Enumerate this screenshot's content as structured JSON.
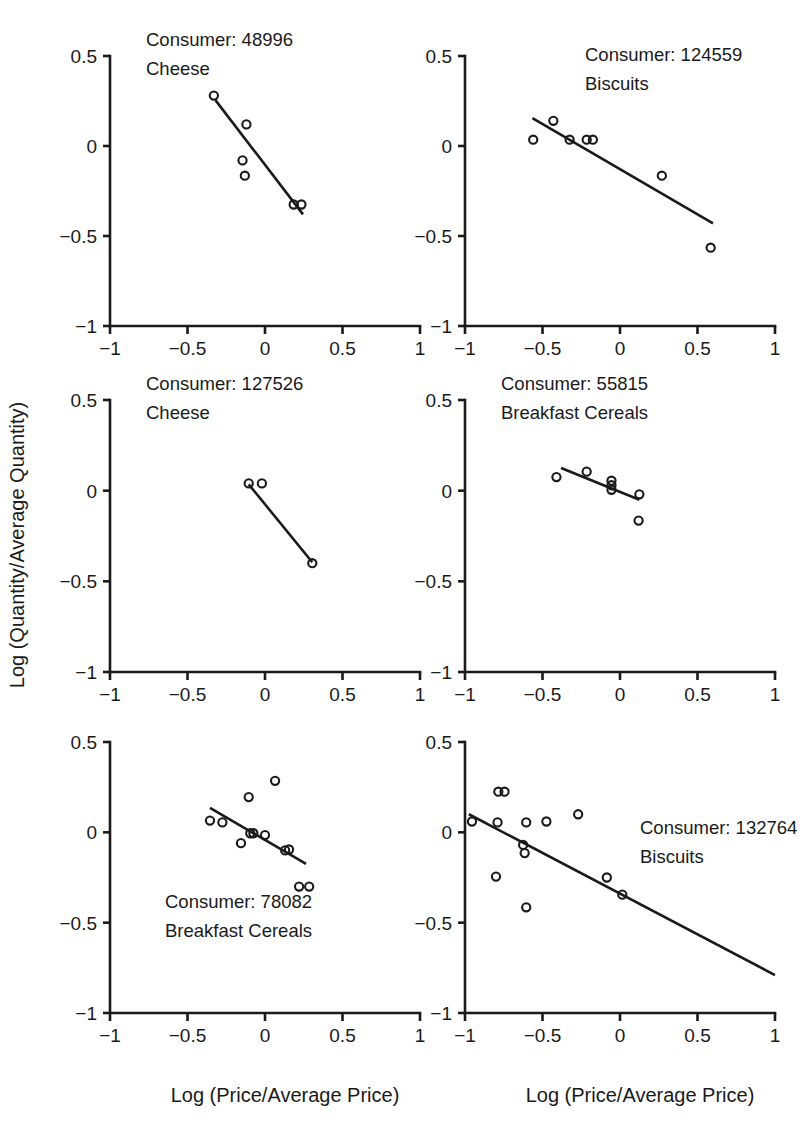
{
  "figure": {
    "xlabel": "Log (Price/Average Price)",
    "ylabel": "Log (Quantity/Average Quantity)",
    "axis_color": "#1a1a1a",
    "background": "#ffffff",
    "xticks": [
      "-1",
      "-0.5",
      "0",
      "0.5",
      "1"
    ],
    "yticks": [
      "0.5",
      "0",
      "-0.5",
      "-1"
    ],
    "xlim": [
      -1,
      1
    ],
    "ylim": [
      -1,
      0.5
    ],
    "rows": 3,
    "cols": 2
  },
  "chart_data": [
    {
      "type": "scatter",
      "panel_index": 0,
      "title_line1": "Consumer: 48996",
      "title_line2": "Cheese",
      "consumer_id": "48996",
      "product": "Cheese",
      "title_position": "top-left-inside",
      "xlabel": "Log (Price/Average Price)",
      "ylabel": "Log (Quantity/Average Quantity)",
      "xlim": [
        -1,
        1
      ],
      "ylim": [
        -1,
        0.5
      ],
      "grid": false,
      "legend": "none",
      "points": [
        {
          "x": -0.33,
          "y": 0.28
        },
        {
          "x": -0.12,
          "y": 0.12
        },
        {
          "x": -0.145,
          "y": -0.08
        },
        {
          "x": -0.13,
          "y": -0.165
        },
        {
          "x": 0.185,
          "y": -0.325
        },
        {
          "x": 0.235,
          "y": -0.325
        }
      ],
      "fit_line": {
        "x0": -0.32,
        "y0": 0.255,
        "x1": 0.245,
        "y1": -0.38
      }
    },
    {
      "type": "scatter",
      "panel_index": 1,
      "title_line1": "Consumer: 124559",
      "title_line2": "Biscuits",
      "consumer_id": "124559",
      "product": "Biscuits",
      "title_position": "top-center-inside",
      "xlabel": "Log (Price/Average Price)",
      "ylabel": "Log (Quantity/Average Quantity)",
      "xlim": [
        -1,
        1
      ],
      "ylim": [
        -1,
        0.5
      ],
      "grid": false,
      "legend": "none",
      "points": [
        {
          "x": -0.56,
          "y": 0.035
        },
        {
          "x": -0.43,
          "y": 0.14
        },
        {
          "x": -0.325,
          "y": 0.035
        },
        {
          "x": -0.215,
          "y": 0.035
        },
        {
          "x": -0.175,
          "y": 0.035
        },
        {
          "x": 0.27,
          "y": -0.165
        },
        {
          "x": 0.585,
          "y": -0.565
        }
      ],
      "fit_line": {
        "x0": -0.565,
        "y0": 0.155,
        "x1": 0.6,
        "y1": -0.43
      }
    },
    {
      "type": "scatter",
      "panel_index": 2,
      "title_line1": "Consumer: 127526",
      "title_line2": "Cheese",
      "consumer_id": "127526",
      "product": "Cheese",
      "title_position": "top-left-inside",
      "xlabel": "Log (Price/Average Price)",
      "ylabel": "Log (Quantity/Average Quantity)",
      "xlim": [
        -1,
        1
      ],
      "ylim": [
        -1,
        0.5
      ],
      "grid": false,
      "legend": "none",
      "points": [
        {
          "x": -0.105,
          "y": 0.04
        },
        {
          "x": -0.02,
          "y": 0.04
        },
        {
          "x": 0.305,
          "y": -0.4
        }
      ],
      "fit_line": {
        "x0": -0.105,
        "y0": 0.035,
        "x1": 0.305,
        "y1": -0.395
      }
    },
    {
      "type": "scatter",
      "panel_index": 3,
      "title_line1": "Consumer: 55815",
      "title_line2": "Breakfast Cereals",
      "consumer_id": "55815",
      "product": "Breakfast Cereals",
      "title_position": "top-left-inside",
      "xlabel": "Log (Price/Average Price)",
      "ylabel": "Log (Quantity/Average Quantity)",
      "xlim": [
        -1,
        1
      ],
      "ylim": [
        -1,
        0.5
      ],
      "grid": false,
      "legend": "none",
      "points": [
        {
          "x": -0.41,
          "y": 0.075
        },
        {
          "x": -0.215,
          "y": 0.105
        },
        {
          "x": -0.055,
          "y": 0.055
        },
        {
          "x": -0.055,
          "y": 0.03
        },
        {
          "x": -0.055,
          "y": 0.005
        },
        {
          "x": 0.125,
          "y": -0.02
        },
        {
          "x": 0.12,
          "y": -0.165
        }
      ],
      "fit_line": {
        "x0": -0.38,
        "y0": 0.125,
        "x1": 0.125,
        "y1": -0.05
      }
    },
    {
      "type": "scatter",
      "panel_index": 4,
      "title_line1": "Consumer: 78082",
      "title_line2": "Breakfast Cereals",
      "consumer_id": "78082",
      "product": "Breakfast Cereals",
      "title_position": "bottom-left-inside",
      "xlabel": "Log (Price/Average Price)",
      "ylabel": "Log (Quantity/Average Quantity)",
      "xlim": [
        -1,
        1
      ],
      "ylim": [
        -1,
        0.5
      ],
      "grid": false,
      "legend": "none",
      "points": [
        {
          "x": 0.065,
          "y": 0.285
        },
        {
          "x": -0.105,
          "y": 0.195
        },
        {
          "x": -0.355,
          "y": 0.065
        },
        {
          "x": -0.275,
          "y": 0.055
        },
        {
          "x": -0.155,
          "y": -0.06
        },
        {
          "x": -0.095,
          "y": -0.005
        },
        {
          "x": -0.075,
          "y": -0.005
        },
        {
          "x": 0.0,
          "y": -0.015
        },
        {
          "x": 0.13,
          "y": -0.1
        },
        {
          "x": 0.155,
          "y": -0.095
        },
        {
          "x": 0.22,
          "y": -0.3
        },
        {
          "x": 0.285,
          "y": -0.3
        }
      ],
      "fit_line": {
        "x0": -0.355,
        "y0": 0.135,
        "x1": 0.265,
        "y1": -0.175
      }
    },
    {
      "type": "scatter",
      "panel_index": 5,
      "title_line1": "Consumer: 132764",
      "title_line2": "Biscuits",
      "consumer_id": "132764",
      "product": "Biscuits",
      "title_position": "top-right-inside",
      "xlabel": "Log (Price/Average Price)",
      "ylabel": "Log (Quantity/Average Quantity)",
      "xlim": [
        -1,
        1
      ],
      "ylim": [
        -1,
        0.5
      ],
      "grid": false,
      "legend": "none",
      "points": [
        {
          "x": -0.785,
          "y": 0.225
        },
        {
          "x": -0.745,
          "y": 0.225
        },
        {
          "x": -0.955,
          "y": 0.06
        },
        {
          "x": -0.79,
          "y": 0.055
        },
        {
          "x": -0.605,
          "y": 0.055
        },
        {
          "x": -0.475,
          "y": 0.06
        },
        {
          "x": -0.27,
          "y": 0.1
        },
        {
          "x": -0.625,
          "y": -0.07
        },
        {
          "x": -0.615,
          "y": -0.115
        },
        {
          "x": -0.8,
          "y": -0.245
        },
        {
          "x": -0.605,
          "y": -0.415
        },
        {
          "x": -0.085,
          "y": -0.25
        },
        {
          "x": 0.015,
          "y": -0.345
        }
      ],
      "fit_line": {
        "x0": -0.975,
        "y0": 0.1,
        "x1": 1.0,
        "y1": -0.79
      }
    }
  ]
}
